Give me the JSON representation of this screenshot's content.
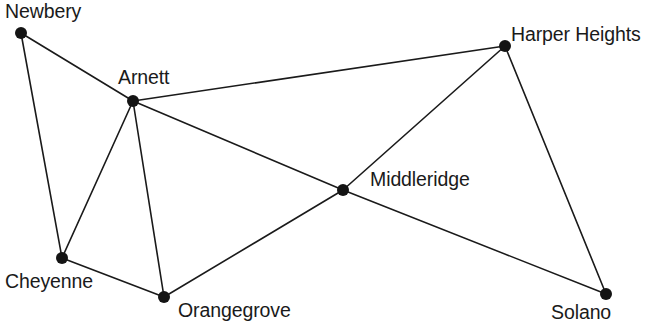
{
  "diagram": {
    "type": "node-link-network-graph",
    "title": "",
    "width": 649,
    "height": 330,
    "background_color": "#ffffff",
    "node_color": "#141414",
    "edge_color": "#1a1a1a",
    "label_color": "#1a1a1a",
    "node_radius": 6,
    "edge_width": 1.6,
    "nodes": [
      {
        "id": "newbery",
        "label": "Newbery",
        "x": 21,
        "y": 33,
        "label_x": 5,
        "label_y": 2,
        "label_anchor": "above-right"
      },
      {
        "id": "arnett",
        "label": "Arnett",
        "x": 133,
        "y": 101,
        "label_x": 118,
        "label_y": 68,
        "label_anchor": "above"
      },
      {
        "id": "harper_heights",
        "label": "Harper Heights",
        "x": 505,
        "y": 46,
        "label_x": 511,
        "label_y": 25,
        "label_anchor": "right-above"
      },
      {
        "id": "middleridge",
        "label": "Middleridge",
        "x": 343,
        "y": 190,
        "label_x": 370,
        "label_y": 170,
        "label_anchor": "right"
      },
      {
        "id": "cheyenne",
        "label": "Cheyenne",
        "x": 62,
        "y": 258,
        "label_x": 5,
        "label_y": 272,
        "label_anchor": "below-left"
      },
      {
        "id": "orangegrove",
        "label": "Orangegrove",
        "x": 164,
        "y": 297,
        "label_x": 178,
        "label_y": 301,
        "label_anchor": "below-right"
      },
      {
        "id": "solano",
        "label": "Solano",
        "x": 606,
        "y": 294,
        "label_x": 551,
        "label_y": 303,
        "label_anchor": "below-left"
      }
    ],
    "edges": [
      {
        "id": "newbery-arnett",
        "source": "newbery",
        "target": "arnett"
      },
      {
        "id": "newbery-cheyenne",
        "source": "newbery",
        "target": "cheyenne"
      },
      {
        "id": "arnett-harper_heights",
        "source": "arnett",
        "target": "harper_heights"
      },
      {
        "id": "arnett-middleridge",
        "source": "arnett",
        "target": "middleridge"
      },
      {
        "id": "arnett-cheyenne",
        "source": "arnett",
        "target": "cheyenne"
      },
      {
        "id": "arnett-orangegrove",
        "source": "arnett",
        "target": "orangegrove"
      },
      {
        "id": "harper_heights-middleridge",
        "source": "harper_heights",
        "target": "middleridge"
      },
      {
        "id": "harper_heights-solano",
        "source": "harper_heights",
        "target": "solano"
      },
      {
        "id": "middleridge-orangegrove",
        "source": "middleridge",
        "target": "orangegrove"
      },
      {
        "id": "middleridge-solano",
        "source": "middleridge",
        "target": "solano"
      },
      {
        "id": "cheyenne-orangegrove",
        "source": "cheyenne",
        "target": "orangegrove"
      }
    ]
  }
}
